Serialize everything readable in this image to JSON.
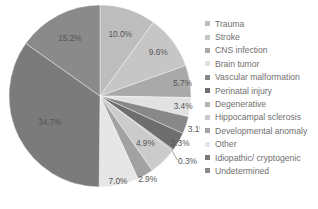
{
  "chart_data": {
    "type": "pie",
    "title": "",
    "categories": [
      "Trauma",
      "Stroke",
      "CNS infection",
      "Brain tumor",
      "Vascular malformation",
      "Perinatal injury",
      "Degenerative",
      "Hippocampal sclerosis",
      "Developmental anomaly",
      "Other",
      "Idiopathic/ cryptogenic",
      "Undetermined"
    ],
    "values": [
      10.0,
      9.6,
      5.7,
      3.4,
      3.1,
      3.3,
      0.3,
      4.9,
      2.9,
      7.0,
      34.7,
      15.2
    ],
    "value_labels": [
      "10.0%",
      "9.6%",
      "5.7%",
      "3.4%",
      "3.1%",
      "3.3%",
      "0.3%",
      "4.9%",
      "2.9%",
      "7.0%",
      "34.7%",
      "15.2%"
    ],
    "colors": [
      "#bdbdbd",
      "#c6c6c6",
      "#a9a9a9",
      "#e2e2e2",
      "#888888",
      "#6e6e6e",
      "#b3b3b3",
      "#cbcbcb",
      "#a2a2a2",
      "#e6e6e6",
      "#7b7b7b",
      "#8a8a8a"
    ],
    "start_angle_deg": 0,
    "direction": "clockwise",
    "legend_position": "right"
  },
  "legend": {
    "items": [
      {
        "label": "Trauma",
        "color": "#bdbdbd"
      },
      {
        "label": "Stroke",
        "color": "#c6c6c6"
      },
      {
        "label": "CNS infection",
        "color": "#a9a9a9"
      },
      {
        "label": "Brain tumor",
        "color": "#e2e2e2"
      },
      {
        "label": "Vascular malformation",
        "color": "#888888"
      },
      {
        "label": "Perinatal injury",
        "color": "#6e6e6e"
      },
      {
        "label": "Degenerative",
        "color": "#b3b3b3"
      },
      {
        "label": "Hippocampal sclerosis",
        "color": "#cbcbcb"
      },
      {
        "label": "Developmental anomaly",
        "color": "#a2a2a2"
      },
      {
        "label": "Other",
        "color": "#e6e6e6"
      },
      {
        "label": "Idiopathic/ cryptogenic",
        "color": "#7b7b7b"
      },
      {
        "label": "Undetermined",
        "color": "#8a8a8a"
      }
    ]
  }
}
